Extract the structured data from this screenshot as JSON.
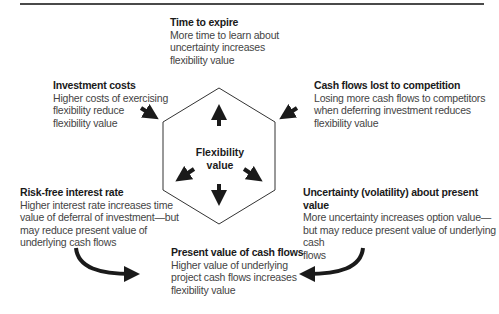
{
  "center": {
    "line1": "Flexibility",
    "line2": "value"
  },
  "factors": {
    "time_to_expire": {
      "title": "Time to expire",
      "desc": [
        "More time to learn about",
        "uncertainty increases",
        "flexibility value"
      ]
    },
    "investment_costs": {
      "title": "Investment costs",
      "desc": [
        "Higher costs of exercising",
        "flexibility reduce",
        "flexibility value"
      ]
    },
    "cash_flows_lost": {
      "title": "Cash flows lost to competition",
      "desc": [
        "Losing more cash flows to competitors",
        "when deferring investment reduces",
        "flexibility value"
      ]
    },
    "risk_free_rate": {
      "title": "Risk-free interest rate",
      "desc": [
        "Higher interest rate increases time",
        "value of deferral of investment—but",
        "may reduce present value of",
        "underlying cash flows"
      ]
    },
    "uncertainty": {
      "title": "Uncertainty (volatility) about present value",
      "desc": [
        "More uncertainty increases option value—",
        "but may reduce present value of underlying cash",
        "flows"
      ]
    },
    "present_value": {
      "title": "Present value of cash flows",
      "desc": [
        "Higher value of underlying",
        "project cash flows increases",
        "flexibility value"
      ]
    }
  },
  "icons": [
    "arrow-up-icon",
    "arrow-down-icon",
    "arrow-down-left-icon",
    "arrow-down-right-icon",
    "arrow-in-from-upper-left-icon",
    "arrow-in-from-upper-right-icon",
    "curved-arrow-left-icon",
    "curved-arrow-right-icon"
  ],
  "colors": {
    "rule": "#4a4a4a",
    "arrow": "#1a1a1a",
    "hexagon": "#333333",
    "text": "#444444"
  }
}
